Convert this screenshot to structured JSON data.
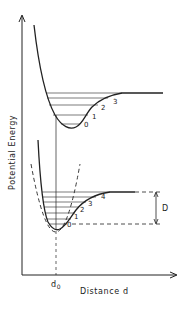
{
  "figure": {
    "type": "potential-energy-curves",
    "y_axis_label": "Potential Energy",
    "x_axis_label": "Distance d",
    "equilibrium_label": "d",
    "equilibrium_subscript": "0",
    "dissociation_label": "D",
    "upper_curve": {
      "level_labels": [
        "0",
        "1",
        "2",
        "3"
      ]
    },
    "lower_curve": {
      "level_labels": [
        "0",
        "1",
        "2",
        "3",
        "4"
      ]
    },
    "colors": {
      "line": "#222222",
      "background": "#ffffff"
    }
  }
}
